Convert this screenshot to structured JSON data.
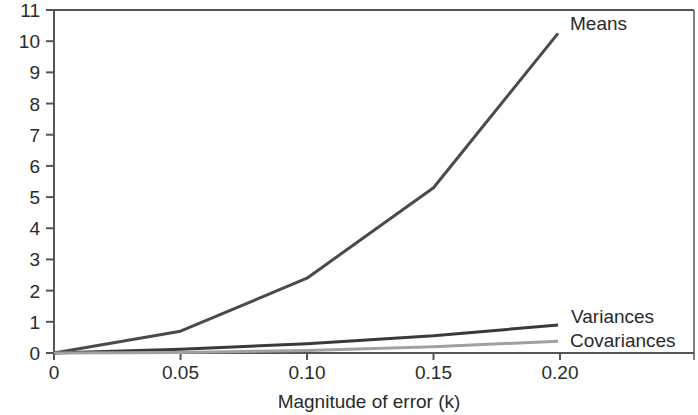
{
  "chart_data": {
    "type": "line",
    "title": "",
    "xlabel": "Magnitude of error (k)",
    "ylabel": "",
    "x": [
      0,
      0.05,
      0.1,
      0.15,
      0.2
    ],
    "x_tick_labels": [
      "0",
      "0.05",
      "0.10",
      "0.15",
      "0.20"
    ],
    "y_tick_labels": [
      "0",
      "1",
      "2",
      "3",
      "4",
      "5",
      "6",
      "7",
      "8",
      "9",
      "10",
      "11"
    ],
    "xlim": [
      0,
      0.255
    ],
    "ylim": [
      0,
      11
    ],
    "grid": false,
    "legend_position": "inline labels at line ends (right)",
    "series": [
      {
        "name": "Means",
        "values": [
          0.0,
          0.7,
          2.4,
          5.3,
          10.25
        ],
        "color": "#4a4a4a",
        "width": 3
      },
      {
        "name": "Variances",
        "values": [
          0.0,
          0.12,
          0.3,
          0.55,
          0.9
        ],
        "color": "#3a3a3a",
        "width": 3
      },
      {
        "name": "Covariances",
        "values": [
          0.0,
          0.02,
          0.08,
          0.2,
          0.38
        ],
        "color": "#a0a0a0",
        "width": 3
      }
    ]
  },
  "labels": {
    "means": "Means",
    "variances": "Variances",
    "covariances": "Covariances",
    "x_axis_title": "Magnitude of error (k)"
  }
}
